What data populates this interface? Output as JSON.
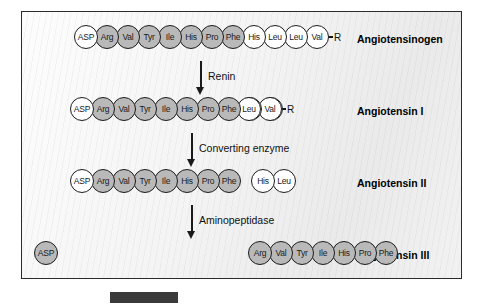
{
  "figure": {
    "rows": [
      {
        "name": "angiotensinogen",
        "label": "Angiotensinogen",
        "segments": [
          {
            "residues": [
              {
                "code": "ASP",
                "fill": "white"
              },
              {
                "code": "Arg",
                "fill": "gray"
              },
              {
                "code": "Val",
                "fill": "gray"
              },
              {
                "code": "Tyr",
                "fill": "gray"
              },
              {
                "code": "Ile",
                "fill": "gray"
              },
              {
                "code": "His",
                "fill": "gray"
              },
              {
                "code": "Pro",
                "fill": "gray"
              },
              {
                "code": "Phe",
                "fill": "gray"
              },
              {
                "code": "His",
                "fill": "white"
              },
              {
                "code": "Leu",
                "fill": "white"
              },
              {
                "code": "Leu",
                "fill": "white"
              },
              {
                "code": "Val",
                "fill": "white"
              }
            ],
            "tail": "R"
          }
        ]
      },
      {
        "name": "angiotensin-i",
        "label": "Angiotensin I",
        "segments": [
          {
            "residues": [
              {
                "code": "ASP",
                "fill": "white"
              },
              {
                "code": "Arg",
                "fill": "gray"
              },
              {
                "code": "Val",
                "fill": "gray"
              },
              {
                "code": "Tyr",
                "fill": "gray"
              },
              {
                "code": "Ile",
                "fill": "gray"
              },
              {
                "code": "His",
                "fill": "gray"
              },
              {
                "code": "Pro",
                "fill": "gray"
              },
              {
                "code": "Phe",
                "fill": "gray"
              },
              {
                "code": "His",
                "fill": "white"
              },
              {
                "code": "Leu",
                "fill": "white"
              }
            ],
            "tail": ""
          },
          {
            "residues": [
              {
                "code": "Leu",
                "fill": "white"
              },
              {
                "code": "Val",
                "fill": "white"
              }
            ],
            "tail": "R"
          }
        ]
      },
      {
        "name": "angiotensin-ii",
        "label": "Angiotensin II",
        "segments": [
          {
            "residues": [
              {
                "code": "ASP",
                "fill": "white"
              },
              {
                "code": "Arg",
                "fill": "gray"
              },
              {
                "code": "Val",
                "fill": "gray"
              },
              {
                "code": "Tyr",
                "fill": "gray"
              },
              {
                "code": "Ile",
                "fill": "gray"
              },
              {
                "code": "His",
                "fill": "gray"
              },
              {
                "code": "Pro",
                "fill": "gray"
              },
              {
                "code": "Phe",
                "fill": "gray"
              }
            ],
            "tail": ""
          },
          {
            "residues": [
              {
                "code": "His",
                "fill": "white"
              },
              {
                "code": "Leu",
                "fill": "white"
              }
            ],
            "tail": ""
          }
        ]
      },
      {
        "name": "angiotensin-iii",
        "label": "Angiotensin III",
        "segments": [
          {
            "residues": [
              {
                "code": "ASP",
                "fill": "gray"
              }
            ],
            "tail": ""
          },
          {
            "residues": [
              {
                "code": "Arg",
                "fill": "gray"
              },
              {
                "code": "Val",
                "fill": "gray"
              },
              {
                "code": "Tyr",
                "fill": "gray"
              },
              {
                "code": "Ile",
                "fill": "gray"
              },
              {
                "code": "His",
                "fill": "gray"
              },
              {
                "code": "Pro",
                "fill": "gray"
              },
              {
                "code": "Phe",
                "fill": "gray"
              }
            ],
            "tail": ""
          }
        ]
      }
    ],
    "steps": [
      {
        "name": "renin",
        "label": "Renin"
      },
      {
        "name": "converting-enzyme",
        "label": "Converting enzyme"
      },
      {
        "name": "aminopeptidase",
        "label": "Aminopeptidase"
      }
    ]
  },
  "caption": {
    "text": ""
  },
  "colors": {
    "residue_gray": "#b9b9b9",
    "residue_white": "#ffffff",
    "outline": "#1c1c1c",
    "panel_border": "#2b2b2b"
  }
}
